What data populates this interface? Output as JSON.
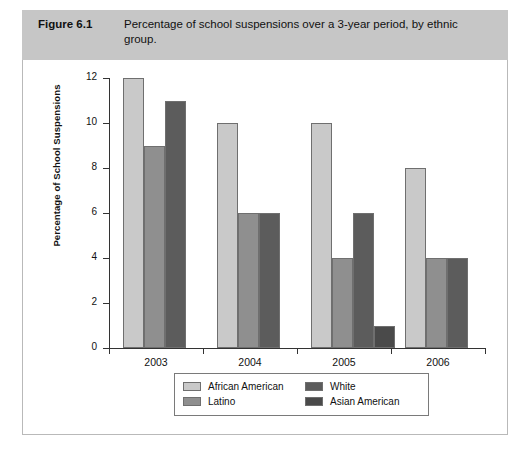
{
  "figure": {
    "number": "Figure 6.1",
    "caption": "Percentage of school suspensions over a 3-year period, by ethnic group."
  },
  "colors": {
    "band": "#c6c6c6",
    "panel": "#ffffff",
    "axis": "#333333",
    "series": [
      "#c9c9c9",
      "#8f8f8f",
      "#5c5c5c",
      "#4a4a4a"
    ]
  },
  "chart_data": {
    "type": "bar",
    "title": "Percentage of school suspensions over a 3-year period, by ethnic group.",
    "xlabel": "",
    "ylabel": "Percentage of School Suspensions",
    "categories": [
      "2003",
      "2004",
      "2005",
      "2006"
    ],
    "ylim": [
      0,
      12
    ],
    "yticks": [
      0,
      2,
      4,
      6,
      8,
      10,
      12
    ],
    "ytick_labels": [
      "0",
      "2",
      "4",
      "6",
      "8",
      "10",
      "12"
    ],
    "grid": false,
    "legend_position": "bottom",
    "series": [
      {
        "name": "African American",
        "color": "#c9c9c9",
        "values": [
          12,
          10,
          10,
          8
        ]
      },
      {
        "name": "Latino",
        "color": "#8f8f8f",
        "values": [
          9,
          6,
          4,
          4
        ]
      },
      {
        "name": "White",
        "color": "#5c5c5c",
        "values": [
          11,
          6,
          6,
          4
        ]
      },
      {
        "name": "Asian American",
        "color": "#4a4a4a",
        "values": [
          null,
          null,
          1,
          null
        ]
      }
    ]
  },
  "legend": {
    "entries": [
      {
        "label": "African American",
        "color": "#c9c9c9"
      },
      {
        "label": "White",
        "color": "#5c5c5c"
      },
      {
        "label": "Latino",
        "color": "#8f8f8f"
      },
      {
        "label": "Asian American",
        "color": "#4a4a4a"
      }
    ]
  }
}
